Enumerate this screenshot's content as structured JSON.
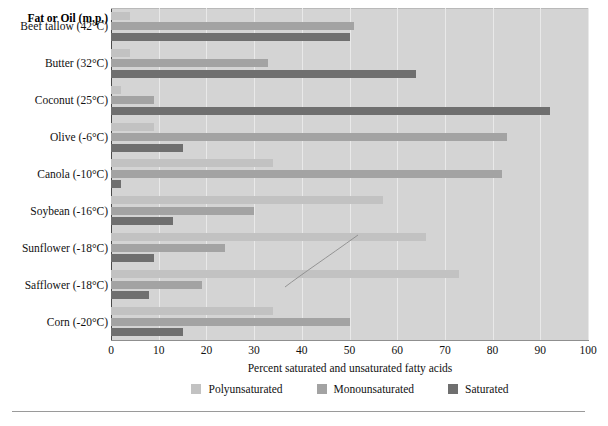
{
  "chart_data": {
    "type": "bar",
    "orientation": "horizontal",
    "title": "",
    "header_label": "Fat or Oil (m.p.)",
    "xlabel": "Percent saturated and unsaturated fatty acids",
    "ylabel": "",
    "xlim": [
      0,
      100
    ],
    "xticks": [
      0,
      10,
      20,
      30,
      40,
      50,
      60,
      70,
      80,
      90,
      100
    ],
    "grid": true,
    "legend_position": "bottom",
    "categories": [
      "Beef tallow (42°C)",
      "Butter (32°C)",
      "Coconut (25°C)",
      "Olive (-6°C)",
      "Canola (-10°C)",
      "Soybean (-16°C)",
      "Sunflower (-18°C)",
      "Safflower (-18°C)",
      "Corn (-20°C)"
    ],
    "series": [
      {
        "name": "Polyunsaturated",
        "color": "#c2c2c2",
        "values": [
          4,
          4,
          2,
          9,
          34,
          57,
          66,
          73,
          34
        ]
      },
      {
        "name": "Monounsaturated",
        "color": "#a3a3a3",
        "values": [
          51,
          33,
          9,
          83,
          82,
          30,
          24,
          19,
          50
        ]
      },
      {
        "name": "Saturated",
        "color": "#6f6f6f",
        "values": [
          50,
          64,
          92,
          15,
          2,
          13,
          9,
          8,
          15
        ]
      }
    ]
  },
  "colors": {
    "plot_background": "#d4d4d4",
    "gridline": "#e9e9e9",
    "axis": "#4a4a4a",
    "text": "#111111",
    "rule": "#9a9a9a"
  }
}
